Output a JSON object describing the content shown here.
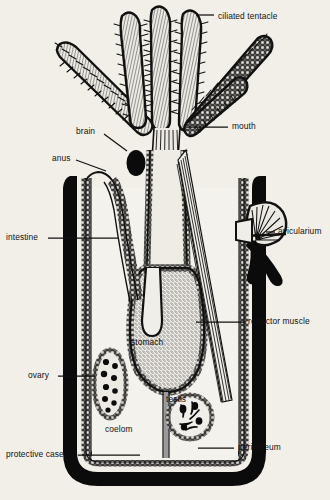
{
  "figure": {
    "style": "black-and-white line drawing on aged paper",
    "background_color": "#f2efe9",
    "ink_color": "#111111"
  },
  "labels": [
    {
      "key": "ciliated_tentacle",
      "text": "ciliated tentacle",
      "x": 218,
      "y": 11,
      "align": "left",
      "leader": [
        [
          214,
          15
        ],
        [
          196,
          15
        ]
      ]
    },
    {
      "key": "mouth",
      "text": "mouth",
      "x": 232,
      "y": 123,
      "align": "left",
      "leader": [
        [
          228,
          127
        ],
        [
          186,
          127
        ]
      ]
    },
    {
      "key": "brain",
      "text": "brain",
      "x": 76,
      "y": 126,
      "align": "left",
      "leader": [
        [
          104,
          134
        ],
        [
          127,
          151
        ]
      ]
    },
    {
      "key": "anus",
      "text": "anus",
      "x": 52,
      "y": 155,
      "align": "left",
      "leader": [
        [
          76,
          160
        ],
        [
          106,
          171
        ]
      ]
    },
    {
      "key": "intestine",
      "text": "intestine",
      "x": 6,
      "y": 233,
      "align": "left",
      "leader": [
        [
          48,
          238
        ],
        [
          118,
          238
        ]
      ]
    },
    {
      "key": "avicularium",
      "text": "avicularium",
      "x": 278,
      "y": 228,
      "align": "left",
      "leader": [
        [
          275,
          232
        ],
        [
          268,
          232
        ]
      ]
    },
    {
      "key": "retractor_muscle",
      "text": "retractor muscle",
      "x": 248,
      "y": 318,
      "align": "left",
      "leader": [
        [
          245,
          322
        ],
        [
          196,
          322
        ]
      ]
    },
    {
      "key": "stomach",
      "text": "stomach",
      "x": 131,
      "y": 338,
      "align": "left",
      "leader": null
    },
    {
      "key": "ovary",
      "text": "ovary",
      "x": 28,
      "y": 372,
      "align": "left",
      "leader": [
        [
          58,
          376
        ],
        [
          95,
          376
        ]
      ]
    },
    {
      "key": "testis",
      "text": "testis",
      "x": 166,
      "y": 396,
      "align": "left",
      "leader": null
    },
    {
      "key": "coelom",
      "text": "coelom",
      "x": 105,
      "y": 426,
      "align": "left",
      "leader": null
    },
    {
      "key": "protective_case",
      "text": "protective case",
      "x": 6,
      "y": 450,
      "align": "left",
      "leader": [
        [
          78,
          455
        ],
        [
          140,
          455
        ]
      ]
    },
    {
      "key": "peritoneum",
      "text": "peritoneum",
      "x": 238,
      "y": 443,
      "align": "left",
      "leader": [
        [
          234,
          448
        ],
        [
          198,
          448
        ]
      ]
    }
  ],
  "anatomy": {
    "tentacles_count": 6,
    "parts": [
      "ciliated tentacle",
      "mouth",
      "brain",
      "anus",
      "intestine",
      "avicularium",
      "retractor muscle",
      "stomach",
      "ovary",
      "testis",
      "coelom",
      "protective case",
      "peritoneum"
    ]
  }
}
